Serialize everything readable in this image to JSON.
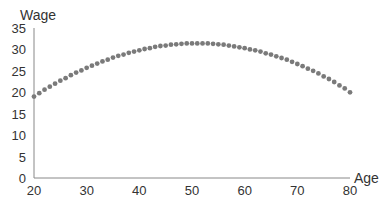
{
  "chart_data": {
    "type": "scatter",
    "title": "",
    "xlabel": "Age",
    "ylabel": "Wage",
    "xlim": [
      20,
      80
    ],
    "ylim": [
      0,
      35
    ],
    "xticks": [
      20,
      30,
      40,
      50,
      60,
      70,
      80
    ],
    "yticks": [
      0,
      5,
      10,
      15,
      20,
      25,
      30,
      35
    ],
    "grid": false,
    "series": [
      {
        "name": "Wage",
        "color": "#7a7a7a",
        "x": [
          20,
          21,
          22,
          23,
          24,
          25,
          26,
          27,
          28,
          29,
          30,
          31,
          32,
          33,
          34,
          35,
          36,
          37,
          38,
          39,
          40,
          41,
          42,
          43,
          44,
          45,
          46,
          47,
          48,
          49,
          50,
          51,
          52,
          53,
          54,
          55,
          56,
          57,
          58,
          59,
          60,
          61,
          62,
          63,
          64,
          65,
          66,
          67,
          68,
          69,
          70,
          71,
          72,
          73,
          74,
          75,
          76,
          77,
          78,
          79,
          80
        ],
        "values": [
          19.0,
          19.8,
          20.6,
          21.3,
          22.0,
          22.7,
          23.3,
          24.0,
          24.6,
          25.1,
          25.7,
          26.2,
          26.7,
          27.2,
          27.6,
          28.1,
          28.5,
          28.8,
          29.2,
          29.5,
          29.8,
          30.1,
          30.3,
          30.6,
          30.8,
          30.9,
          31.1,
          31.2,
          31.3,
          31.4,
          31.4,
          31.4,
          31.4,
          31.4,
          31.3,
          31.2,
          31.1,
          30.9,
          30.7,
          30.5,
          30.3,
          30.0,
          29.8,
          29.5,
          29.1,
          28.8,
          28.4,
          28.0,
          27.6,
          27.1,
          26.6,
          26.1,
          25.5,
          25.0,
          24.4,
          23.7,
          23.1,
          22.4,
          21.6,
          20.9,
          20.0
        ]
      }
    ]
  }
}
